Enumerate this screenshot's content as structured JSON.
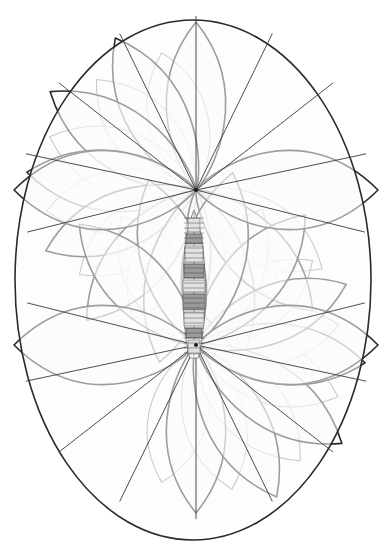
{
  "figure": {
    "title": "",
    "caption": "",
    "kind": "antenna-radiation-pattern",
    "background_color": "#ffffff",
    "line_color_major": "#2a2a2a",
    "line_color_minor": "#8d8d8d",
    "fill_color": "#fbfbfb",
    "canvas": {
      "width": 387,
      "height": 555
    }
  },
  "chart_data": {
    "type": "line",
    "title": "",
    "subtitle": "",
    "xlabel": "",
    "ylabel": "",
    "grid": false,
    "legend_position": "none",
    "annotations": [],
    "nodes": [
      {
        "name": "upper-node",
        "x": 196,
        "y": 190
      },
      {
        "name": "lower-node",
        "x": 196,
        "y": 345
      }
    ],
    "pattern_extent": {
      "left": 14,
      "top": 20,
      "right": 371,
      "bottom": 541
    },
    "series": [
      {
        "name": "upper-lobes",
        "origin": "upper-node",
        "lobe_count": 9,
        "angles_deg": [
          90,
          118,
          146,
          174,
          202,
          230,
          258,
          286,
          314
        ],
        "radii_px": [
          168,
          172,
          176,
          170,
          162,
          170,
          176,
          172,
          168
        ]
      },
      {
        "name": "lower-lobes",
        "origin": "lower-node",
        "lobe_count": 9,
        "angles_deg": [
          270,
          298,
          326,
          354,
          22,
          50,
          78,
          106,
          134
        ],
        "radii_px": [
          168,
          172,
          176,
          170,
          162,
          170,
          176,
          172,
          168
        ]
      },
      {
        "name": "secondary-lobes",
        "origin": "both-nodes",
        "lobe_count": 10,
        "stroke": "#8d8d8d",
        "radii_px": [
          120,
          126,
          132,
          128,
          122,
          122,
          128,
          132,
          126,
          120
        ]
      }
    ],
    "envelope": {
      "name": "outer-envelope",
      "shape": "ellipse",
      "center_x": 193,
      "center_y": 280,
      "radius_x": 178,
      "radius_y": 260
    }
  },
  "vessel": {
    "name": "ship-plan-view",
    "orientation": "vertical",
    "bow_y": 212,
    "stern_y": 360,
    "centerline_x": 194,
    "beam_px": 22,
    "length_px": 148,
    "deck_sections": [
      {
        "name": "forecastle",
        "y": 218,
        "height": 14,
        "width": 12
      },
      {
        "name": "forward-turret",
        "y": 234,
        "height": 10,
        "width": 16
      },
      {
        "name": "forward-superstructure",
        "y": 246,
        "height": 16,
        "width": 18
      },
      {
        "name": "bridge",
        "y": 264,
        "height": 14,
        "width": 20
      },
      {
        "name": "mast-platform",
        "y": 280,
        "height": 12,
        "width": 22
      },
      {
        "name": "amidships",
        "y": 294,
        "height": 16,
        "width": 22
      },
      {
        "name": "aft-superstructure",
        "y": 312,
        "height": 14,
        "width": 20
      },
      {
        "name": "aft-turret",
        "y": 328,
        "height": 10,
        "width": 16
      },
      {
        "name": "quarterdeck",
        "y": 340,
        "height": 14,
        "width": 12
      }
    ]
  }
}
